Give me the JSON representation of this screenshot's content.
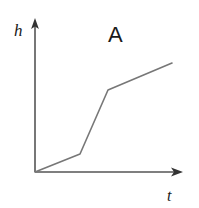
{
  "figure": {
    "panel_label": "A",
    "background_color": "#ffffff",
    "width": 199,
    "height": 208
  },
  "axes": {
    "y_axis_label": "h",
    "x_axis_label": "t",
    "axis_color": "#555555",
    "axis_stroke_width": 1.6,
    "origin": {
      "x": 35,
      "y": 172
    },
    "y_axis_top": {
      "x": 35,
      "y": 19
    },
    "x_axis_right": {
      "x": 182,
      "y": 172
    },
    "y_arrowhead": "arrow-up",
    "x_arrowhead": "arrow-right",
    "ticks": "none",
    "grid": "off"
  },
  "chart_data": {
    "type": "line",
    "title": "A",
    "xlabel": "t",
    "ylabel": "h",
    "grid": false,
    "legend": "none",
    "axis_ticks": false,
    "line_color": "#777777",
    "line_width": 1.6,
    "xlim": [
      0,
      1
    ],
    "ylim": [
      0,
      1
    ],
    "series": [
      {
        "name": "h(t)",
        "points_px": [
          {
            "x": 35,
            "y": 172
          },
          {
            "x": 80,
            "y": 154
          },
          {
            "x": 108,
            "y": 90
          },
          {
            "x": 172,
            "y": 63
          }
        ],
        "x": [
          0.0,
          0.31,
          0.5,
          0.93
        ],
        "values": [
          0.0,
          0.12,
          0.54,
          0.71
        ],
        "segment_slopes": [
          "shallow",
          "steep",
          "shallow"
        ]
      }
    ]
  },
  "labels": {
    "h": {
      "text": "h",
      "x": 14,
      "y": 36,
      "font_size": 17
    },
    "A": {
      "text": "A",
      "x": 108,
      "y": 42,
      "font_size": 22
    },
    "t": {
      "text": "t",
      "x": 167,
      "y": 201,
      "font_size": 16
    }
  }
}
